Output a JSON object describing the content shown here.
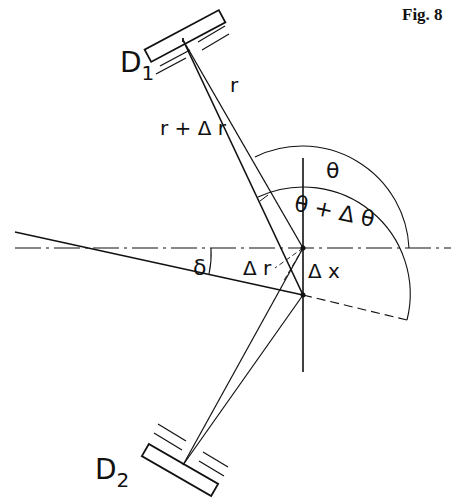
{
  "figure": {
    "caption": "Fig. 8",
    "labels": {
      "detector_top": "D",
      "detector_top_sub": "1",
      "detector_bottom": "D",
      "detector_bottom_sub": "2",
      "radius": "r",
      "radius_plus": "r + Δ r",
      "theta": "θ",
      "theta_plus": "θ + Δ θ",
      "delta": "δ",
      "delta_r": "Δ r",
      "delta_x": "Δ x"
    },
    "colors": {
      "ink": "#111111",
      "background": "#ffffff"
    }
  }
}
